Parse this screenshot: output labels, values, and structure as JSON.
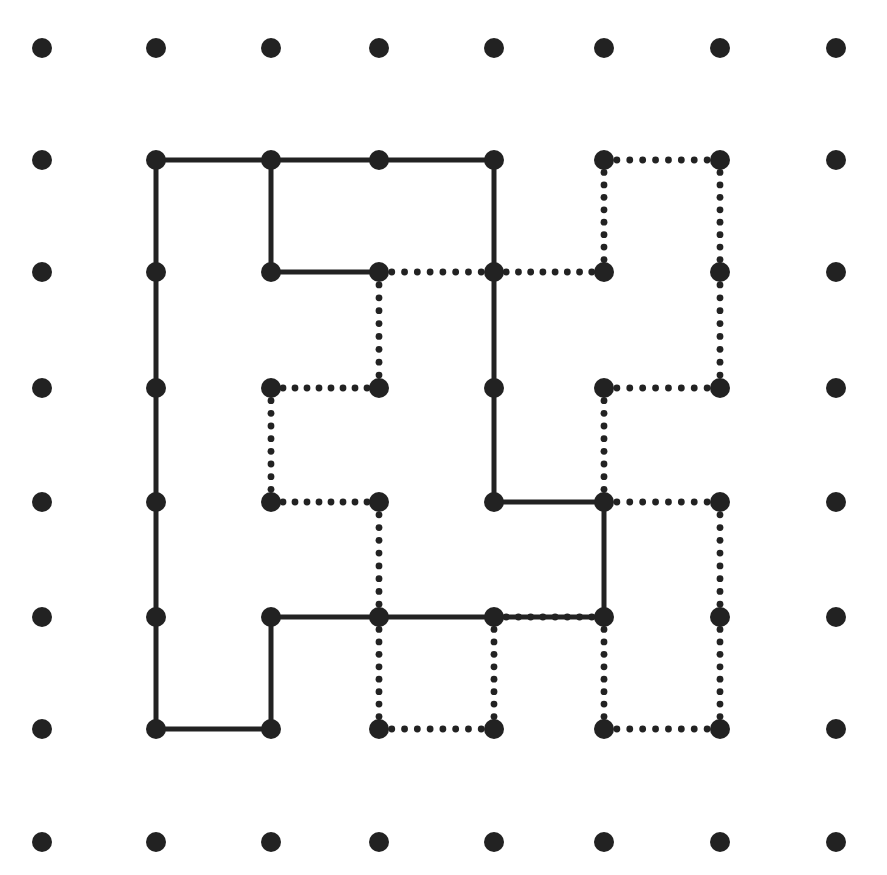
{
  "diagram": {
    "type": "dot-grid-polyomino-dissection",
    "grid": {
      "cols": 8,
      "rows": 8,
      "x": [
        42,
        156,
        271,
        379,
        494,
        604,
        720,
        836
      ],
      "y": [
        48,
        160,
        272,
        388,
        502,
        617,
        729,
        842
      ],
      "dot_radius": 10
    },
    "colors": {
      "ink": "#222222",
      "background": "#ffffff"
    },
    "solid_segments": [
      [
        [
          1,
          1
        ],
        [
          2,
          1
        ]
      ],
      [
        [
          2,
          1
        ],
        [
          3,
          1
        ]
      ],
      [
        [
          3,
          1
        ],
        [
          4,
          1
        ]
      ],
      [
        [
          4,
          1
        ],
        [
          4,
          2
        ]
      ],
      [
        [
          4,
          2
        ],
        [
          4,
          3
        ]
      ],
      [
        [
          4,
          3
        ],
        [
          4,
          4
        ]
      ],
      [
        [
          4,
          4
        ],
        [
          5,
          4
        ]
      ],
      [
        [
          5,
          4
        ],
        [
          5,
          5
        ]
      ],
      [
        [
          5,
          5
        ],
        [
          4,
          5
        ]
      ],
      [
        [
          4,
          5
        ],
        [
          3,
          5
        ]
      ],
      [
        [
          3,
          5
        ],
        [
          2,
          5
        ]
      ],
      [
        [
          2,
          5
        ],
        [
          2,
          6
        ]
      ],
      [
        [
          2,
          6
        ],
        [
          1,
          6
        ]
      ],
      [
        [
          1,
          6
        ],
        [
          1,
          5
        ]
      ],
      [
        [
          1,
          5
        ],
        [
          1,
          4
        ]
      ],
      [
        [
          1,
          4
        ],
        [
          1,
          3
        ]
      ],
      [
        [
          1,
          3
        ],
        [
          1,
          2
        ]
      ],
      [
        [
          1,
          2
        ],
        [
          1,
          1
        ]
      ],
      [
        [
          2,
          1
        ],
        [
          2,
          2
        ]
      ],
      [
        [
          2,
          2
        ],
        [
          3,
          2
        ]
      ]
    ],
    "dotted_segments": [
      [
        [
          3,
          2
        ],
        [
          4,
          2
        ]
      ],
      [
        [
          4,
          2
        ],
        [
          5,
          2
        ]
      ],
      [
        [
          5,
          2
        ],
        [
          5,
          1
        ]
      ],
      [
        [
          5,
          1
        ],
        [
          6,
          1
        ]
      ],
      [
        [
          6,
          1
        ],
        [
          6,
          2
        ]
      ],
      [
        [
          6,
          2
        ],
        [
          6,
          3
        ]
      ],
      [
        [
          6,
          3
        ],
        [
          5,
          3
        ]
      ],
      [
        [
          5,
          3
        ],
        [
          5,
          4
        ]
      ],
      [
        [
          5,
          4
        ],
        [
          6,
          4
        ]
      ],
      [
        [
          6,
          4
        ],
        [
          6,
          5
        ]
      ],
      [
        [
          6,
          5
        ],
        [
          6,
          6
        ]
      ],
      [
        [
          6,
          6
        ],
        [
          5,
          6
        ]
      ],
      [
        [
          5,
          6
        ],
        [
          5,
          5
        ]
      ],
      [
        [
          4,
          5
        ],
        [
          5,
          5
        ]
      ],
      [
        [
          4,
          5
        ],
        [
          4,
          6
        ]
      ],
      [
        [
          4,
          6
        ],
        [
          3,
          6
        ]
      ],
      [
        [
          3,
          6
        ],
        [
          3,
          5
        ]
      ],
      [
        [
          3,
          5
        ],
        [
          3,
          4
        ]
      ],
      [
        [
          3,
          4
        ],
        [
          2,
          4
        ]
      ],
      [
        [
          2,
          4
        ],
        [
          2,
          3
        ]
      ],
      [
        [
          2,
          3
        ],
        [
          3,
          3
        ]
      ],
      [
        [
          3,
          3
        ],
        [
          3,
          2
        ]
      ]
    ]
  }
}
